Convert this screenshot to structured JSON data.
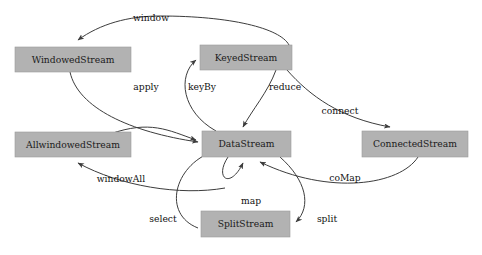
{
  "diagram": {
    "background_color": "#ffffff",
    "node_fill_color": "#b2b2b2",
    "node_stroke_color": "#9a9a9a",
    "edge_color": "#3c3c3c",
    "label_color": "#111111",
    "nodes": [
      {
        "id": "windowed-stream",
        "label": "WindowedStream",
        "x": 15,
        "y": 47,
        "width": 116,
        "height": 25,
        "cx": 73,
        "cy": 59.5
      },
      {
        "id": "keyed-stream",
        "label": "KeyedStream",
        "x": 200,
        "y": 45,
        "width": 92,
        "height": 25,
        "cx": 246,
        "cy": 57.5
      },
      {
        "id": "allwindowed-stream",
        "label": "AllwindowedStream",
        "x": 15,
        "y": 132,
        "width": 116,
        "height": 25,
        "cx": 73,
        "cy": 144.5
      },
      {
        "id": "data-stream",
        "label": "DataStream",
        "x": 202,
        "y": 131,
        "width": 89,
        "height": 26,
        "cx": 246.5,
        "cy": 144
      },
      {
        "id": "connected-stream",
        "label": "ConnectedStream",
        "x": 362,
        "y": 131,
        "width": 106,
        "height": 26,
        "cx": 415,
        "cy": 144
      },
      {
        "id": "split-stream",
        "label": "SplitStream",
        "x": 201,
        "y": 211,
        "width": 89,
        "height": 26,
        "cx": 245.5,
        "cy": 224
      }
    ],
    "edges": [
      {
        "id": "edge-window",
        "label": "window",
        "from": "keyed-stream",
        "to": "windowed-stream",
        "label_x": 151,
        "label_y": 18,
        "path": "M 289 45 C 280 28, 230 16, 160 16 C 128 16, 100 24, 78 40"
      },
      {
        "id": "edge-apply",
        "label": "apply",
        "from": "windowed-stream",
        "to": "data-stream",
        "label_x": 146,
        "label_y": 87,
        "path": "M 70 72 C 78 108, 130 132, 198 142"
      },
      {
        "id": "edge-keyby",
        "label": "keyBy",
        "from": "data-stream",
        "to": "keyed-stream",
        "label_x": 202,
        "label_y": 87,
        "path": "M 216 131 C 182 112, 177 76, 196 60"
      },
      {
        "id": "edge-reduce",
        "label": "reduce",
        "from": "keyed-stream",
        "to": "data-stream",
        "label_x": 285,
        "label_y": 87,
        "path": "M 276 70 C 268 92, 252 110, 243 127"
      },
      {
        "id": "edge-connect",
        "label": "connect",
        "from": "data-stream",
        "to": "connected-stream",
        "label_x": 340,
        "label_y": 111,
        "path": "M 287 70 C 310 96, 340 118, 390 127"
      },
      {
        "id": "edge-windowall",
        "label": "windowAll",
        "from": "data-stream",
        "to": "allwindowed-stream",
        "label_x": 121,
        "label_y": 179,
        "path": "M 225 188 C 180 196, 120 186, 78 163"
      },
      {
        "id": "edge-comap",
        "label": "coMap",
        "from": "connected-stream",
        "to": "data-stream",
        "label_x": 345,
        "label_y": 178,
        "path": "M 418 157 C 400 185, 330 196, 260 162"
      },
      {
        "id": "edge-map",
        "label": "map",
        "from": "data-stream",
        "to": "data-stream",
        "label_x": 251,
        "label_y": 201,
        "path": "M 228 157 C 214 178, 230 190, 243 163"
      },
      {
        "id": "edge-select",
        "label": "select",
        "from": "split-stream",
        "to": "data-stream",
        "label_x": 163,
        "label_y": 219,
        "path": "M 198 228 C 162 214, 174 166, 212 152"
      },
      {
        "id": "edge-split",
        "label": "split",
        "from": "data-stream",
        "to": "split-stream",
        "label_x": 327,
        "label_y": 219,
        "path": "M 280 157 C 306 180, 312 206, 296 222"
      },
      {
        "id": "edge-lower-left-into-data",
        "label": "",
        "from": "allwindowed-stream",
        "to": "data-stream",
        "label_x": 0,
        "label_y": 0,
        "path": "M 110 134 C 150 120, 168 130, 196 140"
      }
    ]
  }
}
